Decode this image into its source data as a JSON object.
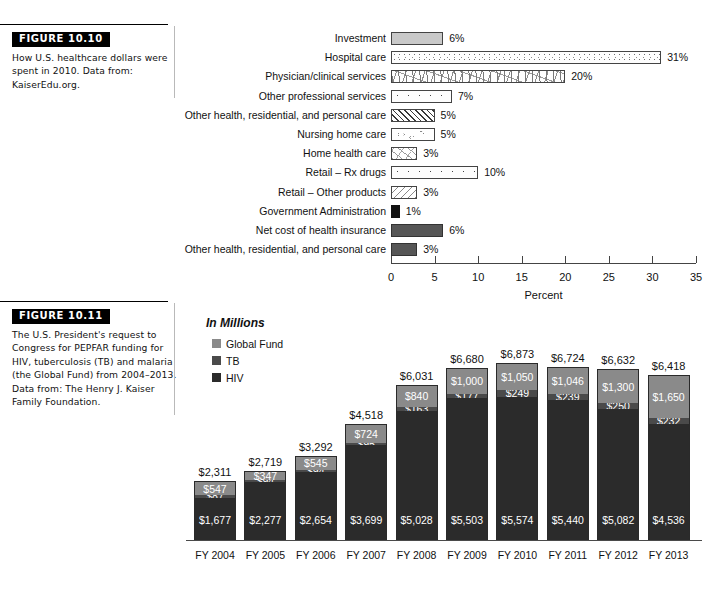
{
  "figures": [
    {
      "tag": "FIGURE 10.10",
      "caption": "How U.S. healthcare dollars were spent in 2010. Data from: KaiserEdu.org."
    },
    {
      "tag": "FIGURE 10.11",
      "caption": "The U.S. President's request to Congress for PEPFAR funding for HIV, tuberculosis (TB) and malaria (the Global Fund) from 2004–2013. Data from: The Henry J. Kaiser Family Foundation."
    }
  ],
  "chart_data": [
    {
      "type": "bar",
      "orientation": "horizontal",
      "title": "",
      "xlabel": "Percent",
      "ylabel": "",
      "xlim": [
        0,
        35
      ],
      "xticks": [
        "0",
        "5",
        "10",
        "15",
        "20",
        "25",
        "30",
        "35"
      ],
      "grid": false,
      "legend": "none",
      "categories": [
        "Investment",
        "Hospital care",
        "Physician/clinical services",
        "Other professional services",
        "Other health, residential, and personal care",
        "Nursing home care",
        "Home health care",
        "Retail – Rx drugs",
        "Retail – Other products",
        "Government Administration",
        "Net cost of health insurance",
        "Other health, residential, and personal care"
      ],
      "values": [
        6,
        31,
        20,
        7,
        5,
        5,
        3,
        10,
        3,
        1,
        6,
        3
      ],
      "value_labels": [
        "6%",
        "31%",
        "20%",
        "7%",
        "5%",
        "5%",
        "3%",
        "10%",
        "3%",
        "1%",
        "6%",
        "3%"
      ],
      "fills": [
        "solid-gray",
        "fine-dots",
        "squiggle",
        "big-dots",
        "hatch-45",
        "pebble",
        "scratch",
        "big-dots",
        "diag-dots",
        "black",
        "dark-gray",
        "dark-gray"
      ]
    },
    {
      "type": "bar",
      "subtype": "stacked",
      "orientation": "vertical",
      "title": "In Millions",
      "xlabel": "",
      "ylabel": "",
      "grid": false,
      "legend_position": "top-left",
      "categories": [
        "FY 2004",
        "FY 2005",
        "FY 2006",
        "FY 2007",
        "FY 2008",
        "FY 2009",
        "FY 2010",
        "FY 2011",
        "FY 2012",
        "FY 2013"
      ],
      "series": [
        {
          "name": "Global Fund",
          "color": "#8a8a8a",
          "values": [
            547,
            347,
            545,
            724,
            840,
            1000,
            1050,
            1046,
            1300,
            1650
          ],
          "labels": [
            "$547",
            "$347",
            "$545",
            "$724",
            "$840",
            "$1,000",
            "$1,050",
            "$1,046",
            "$1,300",
            "$1,650"
          ]
        },
        {
          "name": "TB",
          "color": "#4a4a4a",
          "values": [
            87,
            94,
            94,
            95,
            163,
            177,
            249,
            239,
            250,
            232
          ],
          "labels": [
            "$87",
            "$94",
            "$94",
            "$95",
            "$163",
            "$177",
            "$249",
            "$239",
            "$250",
            "$232"
          ]
        },
        {
          "name": "HIV",
          "color": "#2b2b2b",
          "values": [
            1677,
            2277,
            2654,
            3699,
            5028,
            5503,
            5574,
            5440,
            5082,
            4536
          ],
          "labels": [
            "$1,677",
            "$2,277",
            "$2,654",
            "$3,699",
            "$5,028",
            "$5,503",
            "$5,574",
            "$5,440",
            "$5,082",
            "$4,536"
          ]
        }
      ],
      "totals": [
        2311,
        2719,
        3292,
        4518,
        6031,
        6680,
        6873,
        6724,
        6632,
        6418
      ],
      "total_labels": [
        "$2,311",
        "$2,719",
        "$3,292",
        "$4,518",
        "$6,031",
        "$6,680",
        "$6,873",
        "$6,724",
        "$6,632",
        "$6,418"
      ]
    }
  ]
}
